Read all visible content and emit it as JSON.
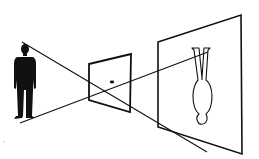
{
  "diagram": {
    "colors": {
      "background": "#ffffff",
      "ink": "#111111"
    },
    "elements": {
      "object": {
        "label": "person",
        "orientation": "upright"
      },
      "aperture": {
        "label": "lens / pinhole panel"
      },
      "screen": {
        "label": "projection screen"
      },
      "image": {
        "label": "inverted person",
        "orientation": "inverted"
      },
      "rays": [
        {
          "label": "ray from head",
          "from": [
            22,
            42
          ],
          "to": [
            207,
            152
          ]
        },
        {
          "label": "ray from feet",
          "from": [
            20,
            123
          ],
          "to": [
            208,
            52
          ]
        }
      ]
    }
  }
}
